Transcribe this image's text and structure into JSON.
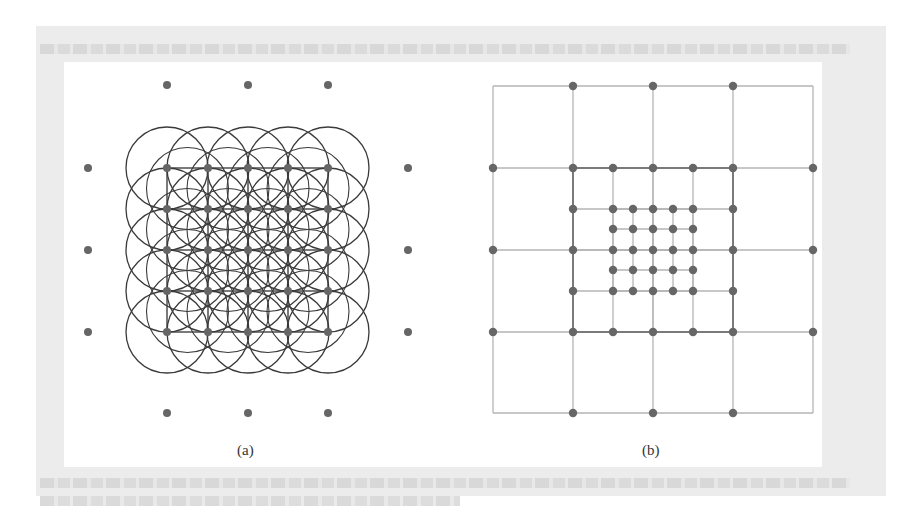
{
  "figure": {
    "subfigures": [
      {
        "id": "a",
        "caption": "(a)",
        "description": "Multiresolution sample points with circular coverage regions overlapping a square grid",
        "outer_dot_positions_x": [
          88,
          167,
          248,
          328,
          408
        ],
        "outer_dot_positions_y": [
          85,
          168,
          250,
          332,
          413
        ],
        "circle_centers_x": [
          167,
          208,
          248,
          288,
          328
        ],
        "circle_centers_y": [
          168,
          209,
          250,
          291,
          332
        ],
        "circle_radius": 41
      },
      {
        "id": "b",
        "caption": "(b)",
        "description": "Hierarchical nested grid with coarse, medium and fine levels of sample points",
        "coarse_grid": {
          "x": [
            493,
            573,
            653,
            733,
            813
          ],
          "y": [
            86,
            168,
            250,
            332,
            413
          ]
        },
        "medium_grid": {
          "x": [
            573,
            613,
            653,
            693,
            733
          ],
          "y": [
            168,
            209,
            250,
            291,
            332
          ]
        },
        "fine_grid": {
          "x": [
            613,
            633,
            653,
            673,
            693
          ],
          "y": [
            209,
            229,
            250,
            270,
            291
          ]
        }
      }
    ],
    "colors": {
      "dot": "#666666",
      "circle_stroke": "#3a3a3a",
      "grid_line": "#b5b5b5",
      "grid_line_bold": "#7a7a7a"
    }
  }
}
